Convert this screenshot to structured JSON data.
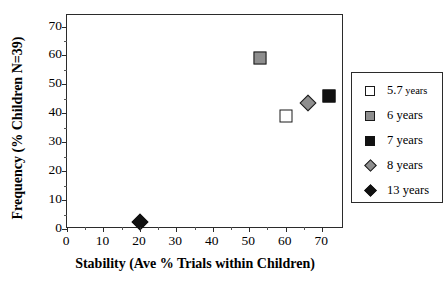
{
  "chart_data": {
    "type": "scatter",
    "title": "",
    "xlabel": "Stability (Ave % Trials within Children)",
    "ylabel": "Frequency (% Children N=39)",
    "xlim": [
      0,
      76
    ],
    "ylim": [
      0,
      74
    ],
    "xticks": [
      0,
      10,
      20,
      30,
      40,
      50,
      60,
      70
    ],
    "yticks": [
      0,
      10,
      20,
      30,
      40,
      50,
      60,
      70
    ],
    "xtick_labels": [
      "0",
      "10",
      "20",
      "30",
      "40",
      "50",
      "60",
      "70"
    ],
    "ytick_labels": [
      "0",
      "10",
      "20",
      "30",
      "40",
      "50",
      "60",
      "70"
    ],
    "grid": false,
    "legend_position": "right-outside",
    "series": [
      {
        "name": "5.7 years",
        "label_main": "5.7",
        "label_unit": "years",
        "marker": "square-open",
        "color": "#ffffff",
        "edge_color": "#1a1a1a",
        "x": 60,
        "y": 39
      },
      {
        "name": "6 years",
        "label_main": "6",
        "label_unit": "years",
        "marker": "square-gray",
        "color": "#8e8e8e",
        "edge_color": "#1a1a1a",
        "x": 53,
        "y": 59
      },
      {
        "name": "7 years",
        "label_main": "7",
        "label_unit": "years",
        "marker": "square-filled",
        "color": "#111111",
        "edge_color": "#111111",
        "x": 72,
        "y": 46
      },
      {
        "name": "8 years",
        "label_main": "8",
        "label_unit": "years",
        "marker": "diamond-gray",
        "color": "#8e8e8e",
        "edge_color": "#1a1a1a",
        "x": 66,
        "y": 43.5
      },
      {
        "name": "13 years",
        "label_main": "13",
        "label_unit": "years",
        "marker": "diamond-filled",
        "color": "#111111",
        "edge_color": "#111111",
        "x": 20,
        "y": 2.5
      }
    ]
  }
}
